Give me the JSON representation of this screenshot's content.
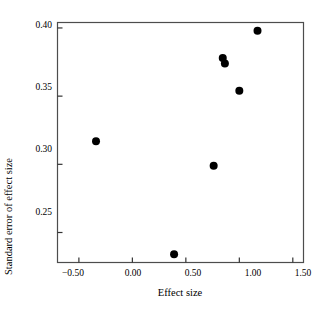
{
  "chart_data": {
    "type": "scatter",
    "title": "",
    "xlabel": "Effect size",
    "ylabel": "Standard error of effect size",
    "xlim": [
      -0.7,
      1.6
    ],
    "ylim": [
      0.228,
      0.404
    ],
    "grid": false,
    "legend": null,
    "xticks": [
      -0.5,
      0.0,
      0.5,
      1.0,
      1.5
    ],
    "xtick_labels": [
      "−0.50",
      "0.00",
      "0.50",
      "1.00",
      "1.50"
    ],
    "yticks": [
      0.25,
      0.3,
      0.35,
      0.4
    ],
    "ytick_labels": [
      "0.25",
      "0.30",
      "0.35",
      "0.40"
    ],
    "marker": "filled-circle",
    "marker_color": "#000000",
    "marker_size_px": 5.2,
    "points": [
      {
        "x": -0.34,
        "y": 0.317
      },
      {
        "x": 0.39,
        "y": 0.234
      },
      {
        "x": 0.76,
        "y": 0.299
      },
      {
        "x": 0.845,
        "y": 0.378
      },
      {
        "x": 0.865,
        "y": 0.374
      },
      {
        "x": 1.0,
        "y": 0.354
      },
      {
        "x": 1.17,
        "y": 0.398
      }
    ],
    "series": [
      {
        "name": "studies",
        "x": [
          -0.34,
          0.39,
          0.76,
          0.845,
          0.865,
          1.0,
          1.17
        ],
        "values": [
          0.317,
          0.234,
          0.299,
          0.378,
          0.374,
          0.354,
          0.398
        ]
      }
    ],
    "n_points": 7
  },
  "axes": {
    "frame_color": "#4d4d4d",
    "tick_direction": "in",
    "background": "#ffffff"
  }
}
